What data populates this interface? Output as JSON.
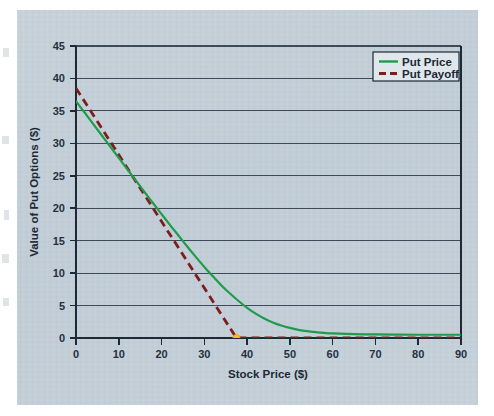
{
  "figure": {
    "background_color": "#ffffff",
    "panel_color": "#c3cfd9",
    "panel_border_color": "#b4c0ca"
  },
  "chart_data": {
    "type": "line",
    "title": "",
    "xlabel": "Stock Price ($)",
    "ylabel": "Value of Put Options ($)",
    "xlim": [
      0,
      90
    ],
    "ylim": [
      0,
      45
    ],
    "xticks": [
      0,
      10,
      20,
      30,
      40,
      50,
      60,
      70,
      80,
      90
    ],
    "yticks": [
      0,
      5,
      10,
      15,
      20,
      25,
      30,
      35,
      40,
      45
    ],
    "xtick_labels": [
      "0",
      "10",
      "20",
      "30",
      "40",
      "50",
      "60",
      "70",
      "80",
      "90"
    ],
    "ytick_labels": [
      "0",
      "5",
      "10",
      "15",
      "20",
      "25",
      "30",
      "35",
      "40",
      "45"
    ],
    "grid": "horizontal",
    "grid_color": "#3c4a5a",
    "legend_position": "top-right",
    "strike_price": 37.5,
    "marker": {
      "name": "kink-marker",
      "x": 37.5,
      "y": 0,
      "color": "#f2c21b"
    },
    "series": [
      {
        "name": "Put Price",
        "color": "#1f9c4a",
        "style": "solid",
        "width": 2.2,
        "x": [
          0,
          2,
          4,
          6,
          8,
          10,
          12,
          14,
          16,
          18,
          20,
          22,
          24,
          26,
          28,
          30,
          32,
          34,
          36,
          38,
          40,
          42,
          44,
          46,
          48,
          50,
          52,
          54,
          56,
          58,
          60,
          65,
          70,
          75,
          80,
          85,
          90
        ],
        "values": [
          36.5,
          34.75,
          33.0,
          31.25,
          29.5,
          27.75,
          26.0,
          24.25,
          22.5,
          20.8,
          19.1,
          17.4,
          15.75,
          14.1,
          12.5,
          10.95,
          9.5,
          8.1,
          6.85,
          5.7,
          4.65,
          3.75,
          3.0,
          2.4,
          1.92,
          1.55,
          1.26,
          1.05,
          0.9,
          0.78,
          0.7,
          0.6,
          0.55,
          0.52,
          0.5,
          0.5,
          0.5
        ]
      },
      {
        "name": "Put Payoff",
        "color": "#7e1d1d",
        "style": "dashed",
        "width": 2.8,
        "x": [
          0,
          37.5,
          90
        ],
        "values": [
          38.5,
          0,
          0
        ]
      }
    ]
  },
  "legend": {
    "items": [
      {
        "label": "Put Price",
        "color": "#1f9c4a",
        "style": "solid"
      },
      {
        "label": "Put Payoff",
        "color": "#7e1d1d",
        "style": "dashed"
      }
    ]
  }
}
